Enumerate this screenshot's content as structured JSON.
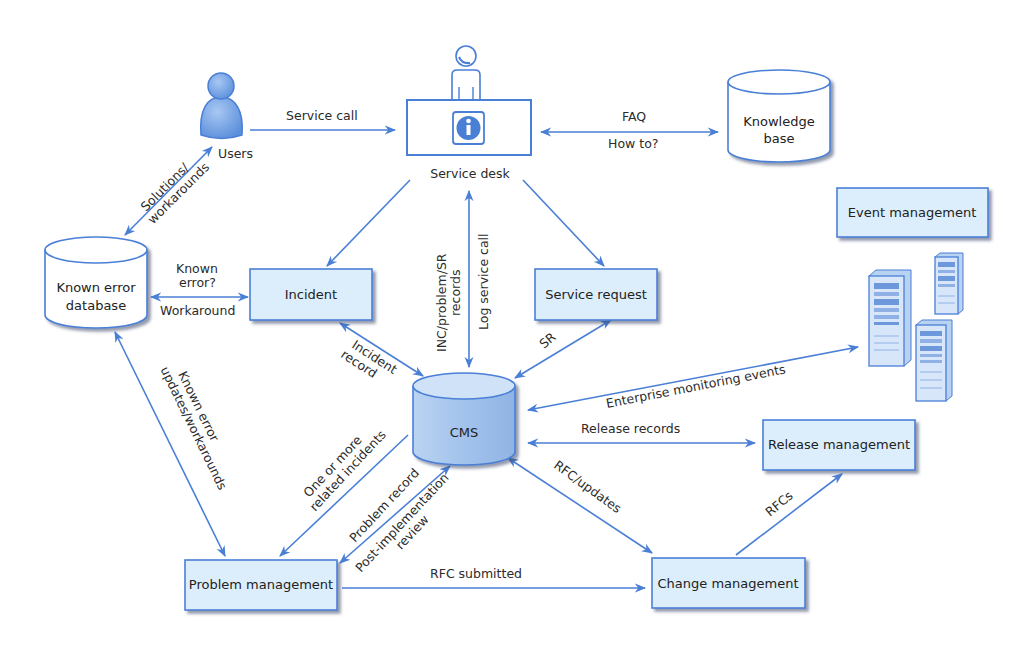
{
  "colors": {
    "line": "#4a7fd6",
    "box_fill": "#dceefb",
    "box_stroke": "#4a7fd6",
    "cms_fill": "#a9c8ee",
    "text": "#2b2b2b"
  },
  "nodes": {
    "users": {
      "label": "Users",
      "icon": "user-icon"
    },
    "service_desk": {
      "label": "Service desk",
      "icon": "info-icon"
    },
    "knowledge_base": {
      "line1": "Knowledge",
      "line2": "base",
      "shape": "database-cylinder"
    },
    "event_management": {
      "label": "Event management"
    },
    "known_error_db": {
      "line1": "Known error",
      "line2": "database",
      "shape": "database-cylinder"
    },
    "incident": {
      "label": "Incident"
    },
    "service_request": {
      "label": "Service request"
    },
    "cms": {
      "label": "CMS",
      "shape": "database-cylinder"
    },
    "servers": {
      "icon": "server-icon"
    },
    "release_management": {
      "label": "Release management"
    },
    "problem_management": {
      "label": "Problem management"
    },
    "change_management": {
      "label": "Change management"
    }
  },
  "edges": {
    "service_call": "Service call",
    "faq": "FAQ",
    "how_to": "How to?",
    "solutions_1": "Solutions/",
    "solutions_2": "workarounds",
    "known_error_q_1": "Known",
    "known_error_q_2": "error?",
    "workaround": "Workaround",
    "inc_problem_sr_1": "INC/problem/SR",
    "inc_problem_sr_2": "records",
    "log_service_call": "Log service call",
    "sr": "SR",
    "incident_record_1": "Incident",
    "incident_record_2": "record",
    "enterprise_monitoring": "Enterprise monitoring events",
    "release_records": "Release records",
    "known_error_updates_1": "Known error",
    "known_error_updates_2": "updates/workarounds",
    "one_or_more_1": "One or more",
    "one_or_more_2": "related incidents",
    "problem_record": "Problem record",
    "post_impl_1": "Post-implementation",
    "post_impl_2": "review",
    "rfc_updates": "RFC/updates",
    "rfcs": "RFCs",
    "rfc_submitted": "RFC submitted"
  }
}
